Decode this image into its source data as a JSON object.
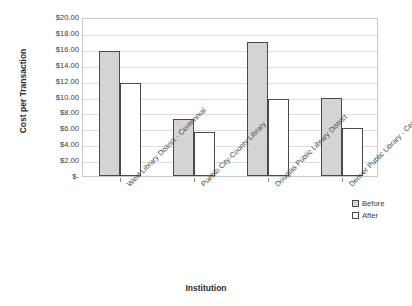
{
  "chart_data": {
    "type": "bar",
    "title": "",
    "xlabel": "Institution",
    "ylabel": "Cost per Transaction",
    "categories": [
      "Weld Library District - Centennial",
      "Pueblo City-County Library",
      "Douglas Public Library District",
      "Denver Public Library - Central"
    ],
    "series": [
      {
        "name": "Before",
        "values": [
          15.75,
          7.15,
          16.9,
          9.8
        ],
        "color": "#d4d4d4"
      },
      {
        "name": "After",
        "values": [
          11.7,
          5.5,
          9.7,
          6.0
        ],
        "color": "#ffffff"
      }
    ],
    "ylim": [
      0,
      20
    ],
    "ytick_values": [
      20,
      18,
      16,
      14,
      12,
      10,
      8,
      6,
      4,
      2,
      0
    ],
    "ytick_labels": [
      "$20.00",
      "$18.00",
      "$16.00",
      "$14.00",
      "$12.00",
      "$10.00",
      "$8.00",
      "$6.00",
      "$4.00",
      "$2.00",
      "$-"
    ],
    "grid": true,
    "legend_position": "right-bottom",
    "legend_entries": [
      "Before",
      "After"
    ]
  }
}
